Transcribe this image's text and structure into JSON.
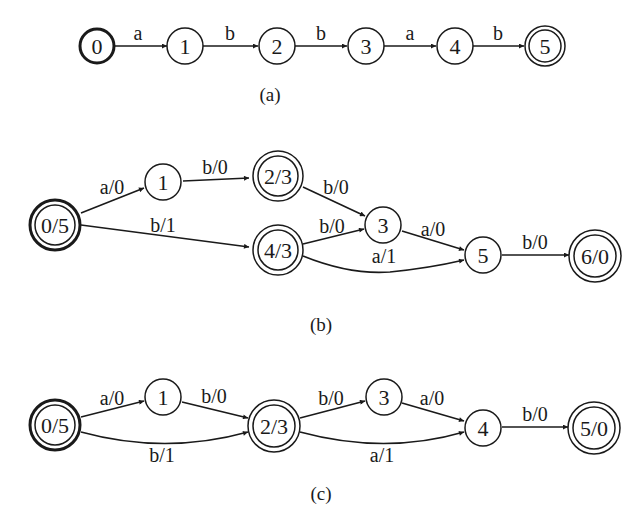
{
  "figure": {
    "panels": [
      {
        "id": "a",
        "caption": "(a)",
        "nodes": [
          {
            "id": "0",
            "label": "0",
            "start": true,
            "final": false
          },
          {
            "id": "1",
            "label": "1",
            "start": false,
            "final": false
          },
          {
            "id": "2",
            "label": "2",
            "start": false,
            "final": false
          },
          {
            "id": "3",
            "label": "3",
            "start": false,
            "final": false
          },
          {
            "id": "4",
            "label": "4",
            "start": false,
            "final": false
          },
          {
            "id": "5",
            "label": "5",
            "start": false,
            "final": true
          }
        ],
        "edges": [
          {
            "from": "0",
            "to": "1",
            "label": "a"
          },
          {
            "from": "1",
            "to": "2",
            "label": "b"
          },
          {
            "from": "2",
            "to": "3",
            "label": "b"
          },
          {
            "from": "3",
            "to": "4",
            "label": "a"
          },
          {
            "from": "4",
            "to": "5",
            "label": "b"
          }
        ]
      },
      {
        "id": "b",
        "caption": "(b)",
        "nodes": [
          {
            "id": "0",
            "label": "0/5",
            "start": true,
            "final": true
          },
          {
            "id": "1",
            "label": "1",
            "start": false,
            "final": false
          },
          {
            "id": "2",
            "label": "2/3",
            "start": false,
            "final": true
          },
          {
            "id": "4",
            "label": "4/3",
            "start": false,
            "final": true
          },
          {
            "id": "3",
            "label": "3",
            "start": false,
            "final": false
          },
          {
            "id": "5",
            "label": "5",
            "start": false,
            "final": false
          },
          {
            "id": "6",
            "label": "6/0",
            "start": false,
            "final": true
          }
        ],
        "edges": [
          {
            "from": "0",
            "to": "1",
            "label": "a/0"
          },
          {
            "from": "0",
            "to": "4",
            "label": "b/1"
          },
          {
            "from": "1",
            "to": "2",
            "label": "b/0"
          },
          {
            "from": "2",
            "to": "3",
            "label": "b/0"
          },
          {
            "from": "4",
            "to": "3",
            "label": "b/0"
          },
          {
            "from": "4",
            "to": "5",
            "label": "a/1"
          },
          {
            "from": "3",
            "to": "5",
            "label": "a/0"
          },
          {
            "from": "5",
            "to": "6",
            "label": "b/0"
          }
        ]
      },
      {
        "id": "c",
        "caption": "(c)",
        "nodes": [
          {
            "id": "0",
            "label": "0/5",
            "start": true,
            "final": true
          },
          {
            "id": "1",
            "label": "1",
            "start": false,
            "final": false
          },
          {
            "id": "2",
            "label": "2/3",
            "start": false,
            "final": true
          },
          {
            "id": "3",
            "label": "3",
            "start": false,
            "final": false
          },
          {
            "id": "4",
            "label": "4",
            "start": false,
            "final": false
          },
          {
            "id": "5",
            "label": "5/0",
            "start": false,
            "final": true
          }
        ],
        "edges": [
          {
            "from": "0",
            "to": "1",
            "label": "a/0"
          },
          {
            "from": "0",
            "to": "2",
            "label": "b/1"
          },
          {
            "from": "1",
            "to": "2",
            "label": "b/0"
          },
          {
            "from": "2",
            "to": "3",
            "label": "b/0"
          },
          {
            "from": "2",
            "to": "4",
            "label": "a/1"
          },
          {
            "from": "3",
            "to": "4",
            "label": "a/0"
          },
          {
            "from": "4",
            "to": "5",
            "label": "b/0"
          }
        ]
      }
    ]
  }
}
